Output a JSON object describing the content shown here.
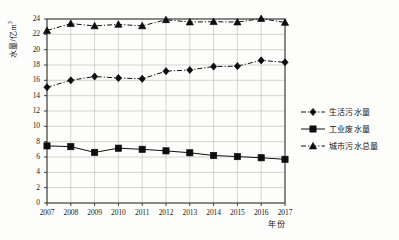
{
  "chart_data": {
    "type": "line",
    "title": "",
    "xlabel": "年份",
    "ylabel": "水量/亿m",
    "ylabel_sup": "3",
    "categories": [
      "2007",
      "2008",
      "2009",
      "2010",
      "2011",
      "2012",
      "2013",
      "2014",
      "2015",
      "2016",
      "2017"
    ],
    "x": [
      2007,
      2008,
      2009,
      2010,
      2011,
      2012,
      2013,
      2014,
      2015,
      2016,
      2017
    ],
    "ylim": [
      0,
      24
    ],
    "ytick_step": 2,
    "yticks": [
      "0",
      "2",
      "4",
      "6",
      "8",
      "10",
      "12",
      "14",
      "16",
      "18",
      "20",
      "22",
      "24"
    ],
    "grid": true,
    "legend_position": "right",
    "series": [
      {
        "name": "生活污水量",
        "marker": "diamond",
        "line_style": "dash-dot",
        "color": "#111111",
        "values": [
          15.1,
          16.0,
          16.5,
          16.3,
          16.2,
          17.2,
          17.35,
          17.8,
          17.85,
          18.6,
          18.35
        ]
      },
      {
        "name": "工业废水量",
        "marker": "square",
        "line_style": "solid",
        "color": "#111111",
        "values": [
          7.45,
          7.35,
          6.6,
          7.15,
          7.0,
          6.8,
          6.55,
          6.2,
          6.05,
          5.9,
          5.7
        ]
      },
      {
        "name": "城市污水总量",
        "marker": "triangle",
        "line_style": "dash-dot",
        "color": "#111111",
        "values": [
          22.5,
          23.4,
          23.1,
          23.3,
          23.1,
          23.9,
          23.6,
          23.65,
          23.6,
          24.05,
          23.55
        ]
      }
    ]
  },
  "legend": {
    "items": [
      {
        "label": "生活污水量",
        "marker": "diamond"
      },
      {
        "label": "工业废水量",
        "marker": "square"
      },
      {
        "label": "城市污水总量",
        "marker": "triangle"
      }
    ]
  }
}
